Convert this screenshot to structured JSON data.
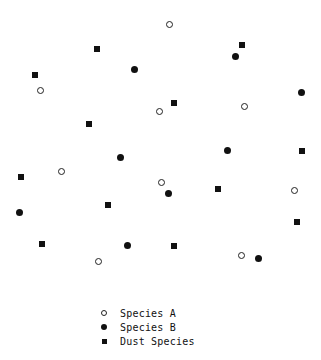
{
  "diagram": {
    "type": "particle-distribution",
    "species": [
      {
        "key": "a",
        "name": "Species A",
        "marker": "open-circle",
        "points": [
          [
            169,
            24
          ],
          [
            40,
            90
          ],
          [
            159,
            111
          ],
          [
            244,
            106
          ],
          [
            61,
            171
          ],
          [
            161,
            182
          ],
          [
            294,
            190
          ],
          [
            98,
            261
          ],
          [
            241,
            255
          ]
        ]
      },
      {
        "key": "b",
        "name": "Species B",
        "marker": "filled-circle",
        "points": [
          [
            134,
            69
          ],
          [
            235,
            56
          ],
          [
            301,
            92
          ],
          [
            120,
            157
          ],
          [
            227,
            150
          ],
          [
            168,
            193
          ],
          [
            19,
            212
          ],
          [
            127,
            245
          ],
          [
            258,
            258
          ]
        ]
      },
      {
        "key": "d",
        "name": "Dust Species",
        "marker": "filled-square",
        "points": [
          [
            97,
            49
          ],
          [
            242,
            45
          ],
          [
            35,
            75
          ],
          [
            174,
            103
          ],
          [
            89,
            124
          ],
          [
            302,
            151
          ],
          [
            21,
            177
          ],
          [
            218,
            189
          ],
          [
            108,
            205
          ],
          [
            297,
            222
          ],
          [
            42,
            244
          ],
          [
            174,
            246
          ]
        ]
      }
    ]
  },
  "legend": {
    "items": [
      {
        "label": "Species A",
        "marker": "open-circle"
      },
      {
        "label": "Species B",
        "marker": "filled-circle"
      },
      {
        "label": "Dust Species",
        "marker": "filled-square"
      }
    ]
  }
}
